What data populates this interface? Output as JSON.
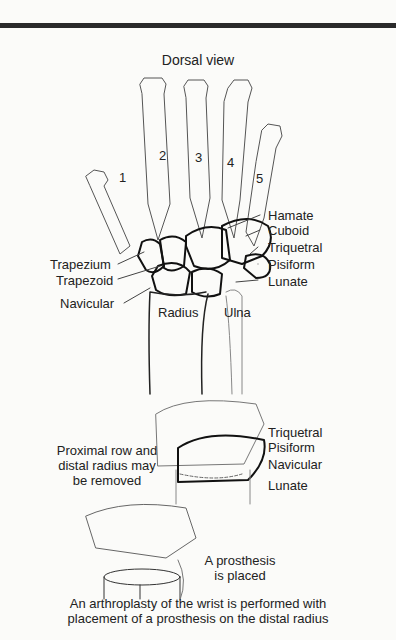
{
  "title": "Dorsal view",
  "metacarpal_numbers": [
    "1",
    "2",
    "3",
    "4",
    "5"
  ],
  "top_labels_right": [
    "Hamate",
    "Cuboid",
    "Triquetral",
    "Pisiform",
    "Lunate"
  ],
  "top_labels_left": [
    "Trapezium",
    "Trapezoid",
    "Navicular"
  ],
  "forearm_labels": [
    "Radius",
    "Ulna"
  ],
  "step2": {
    "note_lines": [
      "Proximal row and",
      "distal radius may",
      "be removed"
    ],
    "labels": [
      "Triquetral",
      "Pisiform",
      "Navicular",
      "Lunate"
    ]
  },
  "step3": {
    "note_lines": [
      "A prosthesis",
      "is placed"
    ]
  },
  "caption_lines": [
    "An arthroplasty of the wrist is performed with",
    "placement of a prosthesis on the distal radius"
  ]
}
